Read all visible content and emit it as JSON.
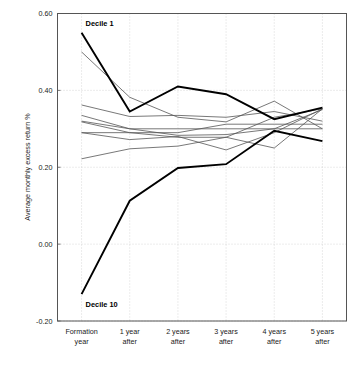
{
  "chart_data": {
    "type": "line",
    "title": "",
    "xlabel": "",
    "ylabel": "Average monthly excess return %",
    "categories": [
      "Formation year",
      "1 year after",
      "2 years after",
      "3 years after",
      "4 years after",
      "5 years after"
    ],
    "category_lines": [
      [
        "Formation",
        "year"
      ],
      [
        "1 year",
        "after"
      ],
      [
        "2 years",
        "after"
      ],
      [
        "3 years",
        "after"
      ],
      [
        "4 years",
        "after"
      ],
      [
        "5 years",
        "after"
      ]
    ],
    "ylim": [
      -0.2,
      0.6
    ],
    "yticks": [
      0.6,
      0.4,
      0.2,
      0.0,
      -0.2
    ],
    "ytick_labels": [
      "0.60",
      "0.40",
      "0.20",
      "0.00",
      "-0.20"
    ],
    "grid": true,
    "grid_style": "dotted",
    "legend": "none",
    "annotations": [
      {
        "text": "Decile 1",
        "x_category": "Formation year",
        "y": 0.575
      },
      {
        "text": "Decile 10",
        "x_category": "Formation year",
        "y": -0.155
      }
    ],
    "series": [
      {
        "name": "Decile 1",
        "emphasis": "bold",
        "values": [
          0.55,
          0.345,
          0.41,
          0.39,
          0.325,
          0.355
        ]
      },
      {
        "name": "Decile 2",
        "emphasis": "thin",
        "values": [
          0.5,
          0.382,
          0.33,
          0.318,
          0.372,
          0.3
        ]
      },
      {
        "name": "Decile 3",
        "emphasis": "thin",
        "values": [
          0.362,
          0.332,
          0.335,
          0.33,
          0.345,
          0.32
        ]
      },
      {
        "name": "Decile 4",
        "emphasis": "thin",
        "values": [
          0.335,
          0.3,
          0.283,
          0.285,
          0.3,
          0.35
        ]
      },
      {
        "name": "Decile 5",
        "emphasis": "thin",
        "values": [
          0.32,
          0.3,
          0.3,
          0.3,
          0.3,
          0.3
        ]
      },
      {
        "name": "Decile 6",
        "emphasis": "thin",
        "values": [
          0.318,
          0.29,
          0.29,
          0.312,
          0.312,
          0.312
        ]
      },
      {
        "name": "Decile 7",
        "emphasis": "thin",
        "values": [
          0.29,
          0.29,
          0.278,
          0.278,
          0.33,
          0.352
        ]
      },
      {
        "name": "Decile 8",
        "emphasis": "thin",
        "values": [
          0.29,
          0.272,
          0.28,
          0.245,
          0.29,
          0.352
        ]
      },
      {
        "name": "Decile 9",
        "emphasis": "thin",
        "values": [
          0.222,
          0.248,
          0.255,
          0.278,
          0.25,
          0.352
        ]
      },
      {
        "name": "Decile 10",
        "emphasis": "bold",
        "values": [
          -0.13,
          0.113,
          0.198,
          0.208,
          0.295,
          0.268
        ]
      }
    ]
  }
}
